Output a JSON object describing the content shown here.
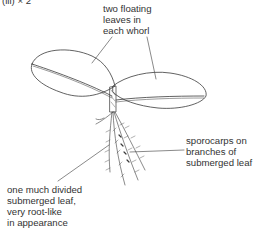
{
  "figure": {
    "caption": "(iii) × 2"
  },
  "labels": {
    "floating_leaves": [
      "two floating",
      "leaves in",
      "each whorl"
    ],
    "sporocarps": [
      "sporocarps on",
      "branches of",
      "submerged leaf"
    ],
    "submerged_leaf": [
      "one much divided",
      "submerged leaf,",
      "very root-like",
      "in appearance"
    ]
  },
  "colors": {
    "line": "#3a3a3a",
    "text": "#333333",
    "background": "#ffffff"
  }
}
